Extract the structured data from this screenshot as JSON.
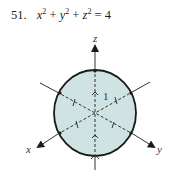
{
  "problem": {
    "number": "51.",
    "equation_parts": {
      "x": "x",
      "y": "y",
      "z": "z",
      "exp": "2",
      "plus": "+",
      "equals": "=",
      "rhs": "4"
    }
  },
  "figure": {
    "axis_labels": {
      "x": "x",
      "y": "y",
      "z": "z"
    },
    "tick_label": "1",
    "sphere_fill": "#cfe3e3",
    "stroke": "#1a1a1a"
  }
}
